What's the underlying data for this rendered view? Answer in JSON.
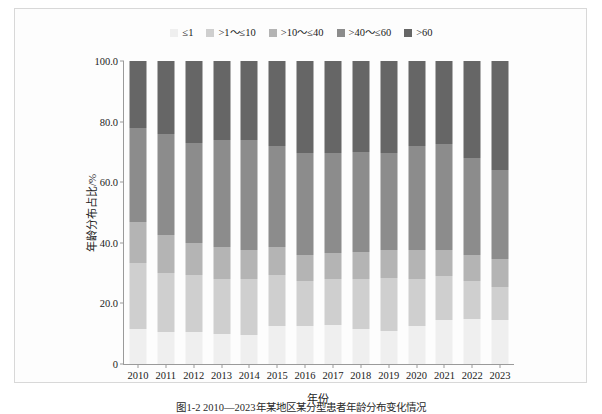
{
  "figure": {
    "caption": "图1-2  2010—2023年某地区某分型患者年龄分布变化情况"
  },
  "chart_data": {
    "type": "bar",
    "subtype": "stacked-percentage",
    "title": "",
    "xlabel": "年份",
    "ylabel": "年龄分布占比/%",
    "ylim": [
      0,
      100
    ],
    "yticks": [
      "0",
      "20.0",
      "40.0",
      "60.0",
      "80.0",
      "100.0"
    ],
    "ytick_values": [
      0,
      20,
      40,
      60,
      80,
      100
    ],
    "grid": false,
    "legend_position": "top-center",
    "categories": [
      "2010",
      "2011",
      "2012",
      "2013",
      "2014",
      "2015",
      "2016",
      "2017",
      "2018",
      "2019",
      "2020",
      "2021",
      "2022",
      "2023"
    ],
    "series": [
      {
        "name": "≤1",
        "color": "#efefef",
        "values": [
          11.5,
          10.5,
          10.5,
          10.0,
          9.5,
          12.5,
          12.5,
          13.0,
          11.5,
          11.0,
          12.5,
          14.5,
          15.0,
          14.5
        ]
      },
      {
        "name": ">1～≤10",
        "color": "#cfcfcf",
        "values": [
          22.0,
          19.5,
          19.0,
          18.0,
          18.5,
          17.0,
          15.0,
          15.0,
          16.5,
          17.5,
          15.5,
          14.5,
          12.5,
          11.0
        ]
      },
      {
        "name": ">10～≤40",
        "color": "#b4b4b4",
        "values": [
          13.5,
          12.5,
          10.5,
          10.5,
          9.5,
          9.0,
          8.5,
          8.5,
          9.0,
          9.0,
          9.5,
          8.5,
          8.5,
          9.0
        ]
      },
      {
        "name": ">40～≤60",
        "color": "#8c8c8c",
        "values": [
          31.0,
          33.5,
          33.0,
          35.5,
          36.5,
          33.5,
          33.5,
          33.0,
          33.0,
          32.0,
          34.5,
          35.0,
          32.0,
          29.5
        ]
      },
      {
        "name": ">60",
        "color": "#666666",
        "values": [
          22.0,
          24.0,
          27.0,
          26.0,
          26.0,
          28.0,
          30.5,
          30.5,
          30.0,
          30.5,
          28.0,
          27.5,
          32.0,
          36.0
        ]
      }
    ]
  }
}
